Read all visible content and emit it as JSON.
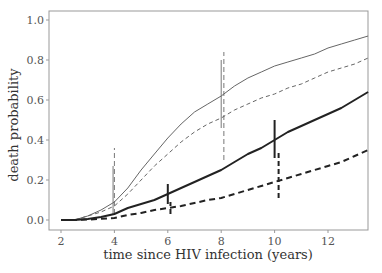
{
  "chart_data": {
    "type": "line",
    "title": "",
    "xlabel": "time since HIV infection (years)",
    "ylabel": "death probability",
    "xlim": [
      1.55,
      13.5
    ],
    "ylim": [
      -0.04,
      1.04
    ],
    "xticks": [
      2,
      4,
      6,
      8,
      10,
      12
    ],
    "xtick_labels": [
      "2",
      "4",
      "6",
      "8",
      "10",
      "12"
    ],
    "yticks": [
      0.0,
      0.2,
      0.4,
      0.6,
      0.8,
      1.0
    ],
    "ytick_labels": [
      "0.0",
      "0.2",
      "0.4",
      "0.6",
      "0.8",
      "1.0"
    ],
    "grid": false,
    "legend": null,
    "x": [
      2,
      2.5,
      3,
      3.5,
      4,
      4.5,
      5,
      5.5,
      6,
      6.5,
      7,
      7.5,
      8,
      8.5,
      9,
      9.5,
      10,
      10.5,
      11,
      11.5,
      12,
      12.5,
      13,
      13.5
    ],
    "series": [
      {
        "name": "thin solid",
        "style": "solid",
        "width": 1,
        "color": "#666666",
        "values": [
          0,
          0,
          0.02,
          0.05,
          0.09,
          0.16,
          0.25,
          0.33,
          0.41,
          0.48,
          0.54,
          0.58,
          0.62,
          0.67,
          0.71,
          0.74,
          0.77,
          0.79,
          0.81,
          0.83,
          0.86,
          0.88,
          0.9,
          0.92
        ]
      },
      {
        "name": "thin dashed",
        "style": "dashed",
        "width": 1,
        "color": "#666666",
        "values": [
          0,
          0,
          0.02,
          0.04,
          0.07,
          0.13,
          0.2,
          0.27,
          0.33,
          0.39,
          0.44,
          0.48,
          0.51,
          0.55,
          0.58,
          0.61,
          0.63,
          0.66,
          0.68,
          0.71,
          0.74,
          0.76,
          0.78,
          0.81
        ]
      },
      {
        "name": "thick solid",
        "style": "solid",
        "width": 2,
        "color": "#222222",
        "values": [
          0,
          0,
          0.005,
          0.015,
          0.03,
          0.06,
          0.08,
          0.1,
          0.13,
          0.16,
          0.19,
          0.22,
          0.25,
          0.29,
          0.33,
          0.36,
          0.4,
          0.44,
          0.47,
          0.5,
          0.53,
          0.56,
          0.6,
          0.64
        ]
      },
      {
        "name": "thick dashed",
        "style": "dashed",
        "width": 2,
        "color": "#222222",
        "values": [
          0,
          0,
          0.002,
          0.006,
          0.01,
          0.025,
          0.035,
          0.05,
          0.06,
          0.07,
          0.085,
          0.1,
          0.11,
          0.13,
          0.15,
          0.17,
          0.19,
          0.21,
          0.23,
          0.25,
          0.27,
          0.29,
          0.32,
          0.35
        ]
      }
    ],
    "confidence_bars": [
      {
        "x": 4.0,
        "style": "dashed",
        "width": 1,
        "y_from": 0.03,
        "y_to": 0.36
      },
      {
        "x": 3.95,
        "style": "solid",
        "width": 1,
        "y_from": 0.03,
        "y_to": 0.27
      },
      {
        "x": 6.0,
        "style": "solid",
        "width": 2,
        "y_from": 0.08,
        "y_to": 0.18
      },
      {
        "x": 6.1,
        "style": "dashed",
        "width": 2,
        "y_from": 0.03,
        "y_to": 0.09
      },
      {
        "x": 8.0,
        "style": "solid",
        "width": 1,
        "y_from": 0.46,
        "y_to": 0.8
      },
      {
        "x": 8.1,
        "style": "dashed",
        "width": 1,
        "y_from": 0.3,
        "y_to": 0.84
      },
      {
        "x": 10.0,
        "style": "solid",
        "width": 2,
        "y_from": 0.31,
        "y_to": 0.5
      },
      {
        "x": 10.15,
        "style": "dashed",
        "width": 2,
        "y_from": 0.11,
        "y_to": 0.35
      }
    ]
  }
}
